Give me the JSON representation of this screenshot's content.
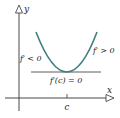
{
  "diagram": {
    "axes": {
      "x_label": "x",
      "y_label": "y"
    },
    "labels": {
      "left_slope": "f′ < 0",
      "right_slope": "f′ > 0",
      "tangent": "f′(c) = 0",
      "critical_point": "c"
    },
    "colors": {
      "curve": "#3f7f7c",
      "axes": "#333333",
      "tangent": "#333333"
    }
  }
}
